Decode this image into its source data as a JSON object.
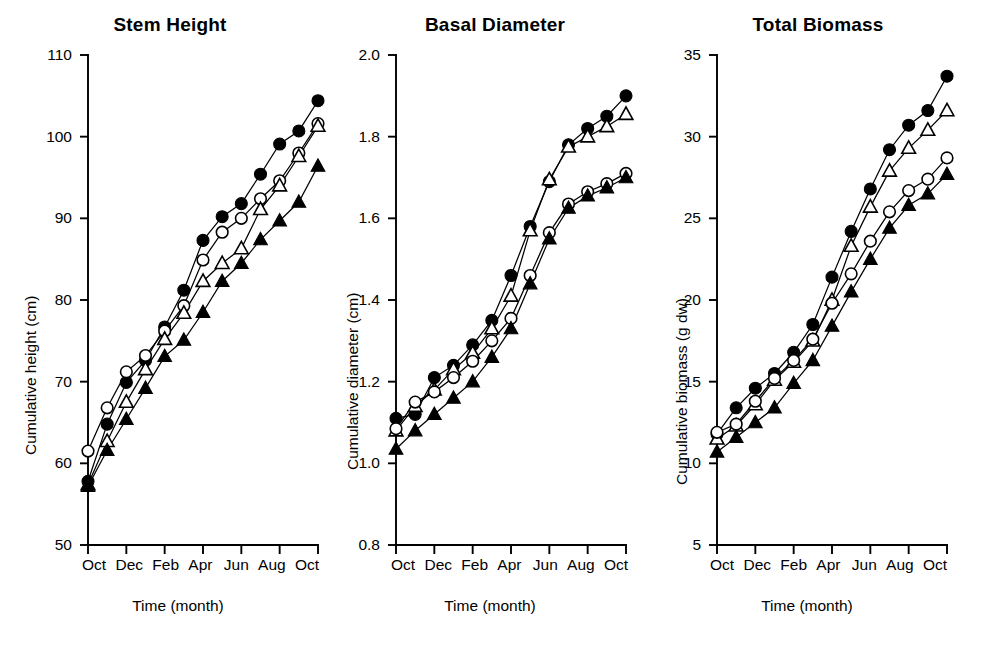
{
  "figure": {
    "background": "#ffffff",
    "ink": "#000000",
    "panel_count": 3
  },
  "chart_data": [
    {
      "type": "line",
      "title": "Stem Height",
      "xlabel": "Time (month)",
      "ylabel": "Cumulative height (cm)",
      "x": [
        "Oct",
        "Nov",
        "Dec",
        "Jan",
        "Feb",
        "Mar",
        "Apr",
        "May",
        "Jun",
        "Jul",
        "Aug",
        "Sep",
        "Oct"
      ],
      "tick_labels": [
        "Oct",
        "Dec",
        "Feb",
        "Apr",
        "Jun",
        "Aug",
        "Oct"
      ],
      "tick_indices": [
        0,
        2,
        4,
        6,
        8,
        10,
        12
      ],
      "ylim": [
        50,
        110
      ],
      "yticks": [
        50,
        60,
        70,
        80,
        90,
        100,
        110
      ],
      "grid": false,
      "legend": "none",
      "series": [
        {
          "name": "filled-circle",
          "marker": "filled-circle",
          "values": [
            57.8,
            64.8,
            69.9,
            72.6,
            76.7,
            81.2,
            87.3,
            90.2,
            91.8,
            95.4,
            99.1,
            100.7,
            104.4
          ]
        },
        {
          "name": "open-circle",
          "marker": "open-circle",
          "values": [
            61.5,
            66.8,
            71.2,
            73.2,
            76.2,
            79.3,
            84.9,
            88.3,
            90.0,
            92.4,
            94.6,
            98.0,
            101.6
          ]
        },
        {
          "name": "open-triangle",
          "marker": "open-triangle",
          "values": [
            57.4,
            62.7,
            67.5,
            71.5,
            75.2,
            78.4,
            82.3,
            84.5,
            86.3,
            91.1,
            94.0,
            97.6,
            101.3
          ]
        },
        {
          "name": "filled-triangle",
          "marker": "filled-triangle",
          "values": [
            57.2,
            61.6,
            65.4,
            69.2,
            73.1,
            75.1,
            78.5,
            82.3,
            84.5,
            87.4,
            89.7,
            92.0,
            96.4
          ]
        }
      ]
    },
    {
      "type": "line",
      "title": "Basal Diameter",
      "xlabel": "Time (month)",
      "ylabel": "Cumulative diameter (cm)",
      "x": [
        "Oct",
        "Nov",
        "Dec",
        "Jan",
        "Feb",
        "Mar",
        "Apr",
        "May",
        "Jun",
        "Jul",
        "Aug",
        "Sep",
        "Oct"
      ],
      "tick_labels": [
        "Oct",
        "Dec",
        "Feb",
        "Apr",
        "Jun",
        "Aug",
        "Oct"
      ],
      "tick_indices": [
        0,
        2,
        4,
        6,
        8,
        10,
        12
      ],
      "ylim": [
        0.8,
        2.0
      ],
      "yticks": [
        0.8,
        1.0,
        1.2,
        1.4,
        1.6,
        1.8,
        2.0
      ],
      "grid": false,
      "legend": "none",
      "series": [
        {
          "name": "filled-circle",
          "marker": "filled-circle",
          "values": [
            1.11,
            1.12,
            1.21,
            1.24,
            1.29,
            1.35,
            1.46,
            1.58,
            1.69,
            1.78,
            1.82,
            1.85,
            1.9
          ]
        },
        {
          "name": "open-triangle",
          "marker": "open-triangle",
          "values": [
            1.08,
            1.14,
            1.18,
            1.23,
            1.27,
            1.33,
            1.41,
            1.57,
            1.695,
            1.775,
            1.8,
            1.825,
            1.855
          ]
        },
        {
          "name": "open-circle",
          "marker": "open-circle",
          "values": [
            1.085,
            1.15,
            1.175,
            1.21,
            1.25,
            1.3,
            1.355,
            1.46,
            1.565,
            1.635,
            1.665,
            1.685,
            1.71
          ]
        },
        {
          "name": "filled-triangle",
          "marker": "filled-triangle",
          "values": [
            1.035,
            1.08,
            1.12,
            1.16,
            1.2,
            1.26,
            1.33,
            1.44,
            1.55,
            1.625,
            1.655,
            1.675,
            1.7
          ]
        }
      ]
    },
    {
      "type": "line",
      "title": "Total Biomass",
      "xlabel": "Time (month)",
      "ylabel": "Cumulative biomass (g dw)",
      "x": [
        "Oct",
        "Nov",
        "Dec",
        "Jan",
        "Feb",
        "Mar",
        "Apr",
        "May",
        "Jun",
        "Jul",
        "Aug",
        "Sep",
        "Oct"
      ],
      "tick_labels": [
        "Oct",
        "Dec",
        "Feb",
        "Apr",
        "Jun",
        "Aug",
        "Oct"
      ],
      "tick_indices": [
        0,
        2,
        4,
        6,
        8,
        10,
        12
      ],
      "ylim": [
        5,
        35
      ],
      "yticks": [
        5,
        10,
        15,
        20,
        25,
        30,
        35
      ],
      "grid": false,
      "legend": "none",
      "series": [
        {
          "name": "filled-circle",
          "marker": "filled-circle",
          "values": [
            11.8,
            13.4,
            14.6,
            15.5,
            16.8,
            18.5,
            21.4,
            24.2,
            26.8,
            29.2,
            30.7,
            31.6,
            33.7
          ]
        },
        {
          "name": "open-triangle",
          "marker": "open-triangle",
          "values": [
            11.5,
            12.3,
            13.6,
            15.1,
            16.2,
            17.5,
            20.0,
            23.3,
            25.7,
            27.9,
            29.3,
            30.4,
            31.6
          ]
        },
        {
          "name": "open-circle",
          "marker": "open-circle",
          "values": [
            11.9,
            12.4,
            13.8,
            15.2,
            16.3,
            17.6,
            19.8,
            21.6,
            23.6,
            25.4,
            26.7,
            27.4,
            28.7
          ]
        },
        {
          "name": "filled-triangle",
          "marker": "filled-triangle",
          "values": [
            10.7,
            11.6,
            12.5,
            13.4,
            14.9,
            16.3,
            18.4,
            20.5,
            22.5,
            24.4,
            25.8,
            26.5,
            27.7
          ]
        }
      ]
    }
  ]
}
